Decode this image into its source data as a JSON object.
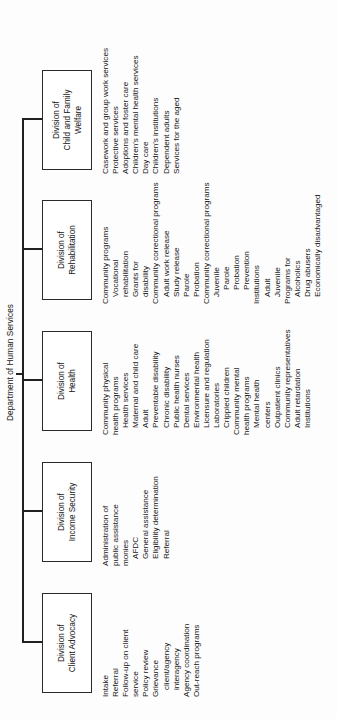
{
  "chart_data": {
    "type": "diagram",
    "title": "Department of Human Services",
    "diagram_kind": "organizational-chart",
    "orientation": "rotated-90-ccw",
    "root": "Department of Human Services",
    "nodes": [
      {
        "id": "client-advocacy",
        "label": "Division of\nClient Advocacy",
        "functions": [
          "Intake",
          "Referral",
          "Follow-up on client",
          "service",
          "Policy review",
          "Grievance",
          "client/agency",
          "interagency",
          "Agency coordination",
          "Out-reach programs"
        ]
      },
      {
        "id": "income-security",
        "label": "Division of\nIncome Security",
        "functions": [
          "Administration of",
          "public assistance",
          "monies",
          "AFDC",
          "General assistance",
          "Eligibility determination",
          "Referral"
        ]
      },
      {
        "id": "health",
        "label": "Division of\nHealth",
        "functions": [
          "Community physical",
          "health programs",
          "Health services",
          "Maternal and child care",
          "Adult",
          "Preventable disability",
          "Chronic disability",
          "Public health nurses",
          "Dental services",
          "Environmental health",
          "Licensure and regulation",
          "Laboratories",
          "Crippled children",
          "Community mental",
          "health programs",
          "Mental health",
          "centers",
          "Outpatient clinics",
          "Community representatives",
          "Adult retardation",
          "Institutions"
        ]
      },
      {
        "id": "rehabilitation",
        "label": "Division of\nRehabilitation",
        "functions": [
          "Community programs",
          "Vocational",
          "rehabilitation",
          "Grants for",
          "disability",
          "Community correctional programs",
          "Adult work release",
          "Study release",
          "Parole",
          "Probation",
          "Community correctional programs",
          "Juvenile",
          "Parole",
          "Probation",
          "Prevention",
          "Institutions",
          "Adult",
          "Juvenile",
          "Programs for",
          "Alcoholics",
          "Drug abusers",
          "Economically disadvantaged"
        ]
      },
      {
        "id": "child-family-welfare",
        "label": "Division of\nChild and Family\nWelfare",
        "functions": [
          "Casework and group work services",
          "Protective services",
          "Adoptions and foster care",
          "Children's mental health services",
          "Day care",
          "Children's institutions",
          "Dependent adults",
          "Services for the aged"
        ]
      }
    ]
  },
  "root": {
    "title": "Department of Human Services"
  },
  "divisions": [
    {
      "name_line1": "Division of",
      "name_line2": "Client Advocacy",
      "name_line3": "",
      "items": [
        {
          "text": "Intake",
          "indent": 0
        },
        {
          "text": "Referral",
          "indent": 0
        },
        {
          "text": "Follow-up on client",
          "indent": 0
        },
        {
          "text": "service",
          "indent": 0
        },
        {
          "text": "Policy review",
          "indent": 0
        },
        {
          "text": "Grievance",
          "indent": 0
        },
        {
          "text": "client/agency",
          "indent": 1
        },
        {
          "text": "interagency",
          "indent": 1
        },
        {
          "text": "Agency coordination",
          "indent": 0
        },
        {
          "text": "Out-reach programs",
          "indent": 0
        }
      ]
    },
    {
      "name_line1": "Division of",
      "name_line2": "Income Security",
      "name_line3": "",
      "items": [
        {
          "text": "Administration of",
          "indent": 0
        },
        {
          "text": "public assistance",
          "indent": 0
        },
        {
          "text": "monies",
          "indent": 0
        },
        {
          "text": "AFDC",
          "indent": 1
        },
        {
          "text": "General assistance",
          "indent": 1
        },
        {
          "text": "Eligibility determination",
          "indent": 1
        },
        {
          "text": "Referral",
          "indent": 1
        }
      ]
    },
    {
      "name_line1": "Division of",
      "name_line2": "Health",
      "name_line3": "",
      "items": [
        {
          "text": "Community physical",
          "indent": 0
        },
        {
          "text": "health programs",
          "indent": 0
        },
        {
          "text": "Health services",
          "indent": 1
        },
        {
          "text": "Maternal and child care",
          "indent": 1
        },
        {
          "text": "Adult",
          "indent": 1
        },
        {
          "text": "Preventable disability",
          "indent": 1
        },
        {
          "text": "Chronic disability",
          "indent": 1
        },
        {
          "text": "Public health nurses",
          "indent": 1
        },
        {
          "text": "Dental services",
          "indent": 1
        },
        {
          "text": "Environmental health",
          "indent": 1
        },
        {
          "text": "Licensure and regulation",
          "indent": 1
        },
        {
          "text": "Laboratories",
          "indent": 1
        },
        {
          "text": "Crippled children",
          "indent": 1
        },
        {
          "text": "Community mental",
          "indent": 0
        },
        {
          "text": "health programs",
          "indent": 0
        },
        {
          "text": "Mental health",
          "indent": 1
        },
        {
          "text": "centers",
          "indent": 1
        },
        {
          "text": "Outpatient clinics",
          "indent": 1
        },
        {
          "text": "Community representatives",
          "indent": 1
        },
        {
          "text": "Adult retardation",
          "indent": 1
        },
        {
          "text": "Institutions",
          "indent": 1
        }
      ]
    },
    {
      "name_line1": "Division of",
      "name_line2": "Rehabilitation",
      "name_line3": "",
      "items": [
        {
          "text": "Community programs",
          "indent": 0
        },
        {
          "text": "Vocational",
          "indent": 1
        },
        {
          "text": "rehabilitation",
          "indent": 1
        },
        {
          "text": "Grants for",
          "indent": 1
        },
        {
          "text": "disability",
          "indent": 1
        },
        {
          "text": "Community correctional programs",
          "indent": 0
        },
        {
          "text": "Adult work release",
          "indent": 1
        },
        {
          "text": "Study release",
          "indent": 1
        },
        {
          "text": "Parole",
          "indent": 1
        },
        {
          "text": "Probation",
          "indent": 1
        },
        {
          "text": "Community correctional programs",
          "indent": 0
        },
        {
          "text": "Juvenile",
          "indent": 1
        },
        {
          "text": "Parole",
          "indent": 2
        },
        {
          "text": "Probation",
          "indent": 2
        },
        {
          "text": "Prevention",
          "indent": 2
        },
        {
          "text": "Institutions",
          "indent": 0
        },
        {
          "text": "Adult",
          "indent": 1
        },
        {
          "text": "Juvenile",
          "indent": 1
        },
        {
          "text": "Programs for",
          "indent": 0
        },
        {
          "text": "Alcoholics",
          "indent": 1
        },
        {
          "text": "Drug abusers",
          "indent": 1
        },
        {
          "text": "Economically disadvantaged",
          "indent": 1
        }
      ]
    },
    {
      "name_line1": "Division of",
      "name_line2": "Child and Family",
      "name_line3": "Welfare",
      "items": [
        {
          "text": "Casework and group work services",
          "indent": 0
        },
        {
          "text": "Protective services",
          "indent": 0
        },
        {
          "text": "Adoptions and foster care",
          "indent": 0
        },
        {
          "text": "Children's mental health services",
          "indent": 0
        },
        {
          "text": "Day care",
          "indent": 0
        },
        {
          "text": "Children's institutions",
          "indent": 0
        },
        {
          "text": "Dependent adults",
          "indent": 0
        },
        {
          "text": "Services for the aged",
          "indent": 0
        }
      ]
    }
  ]
}
